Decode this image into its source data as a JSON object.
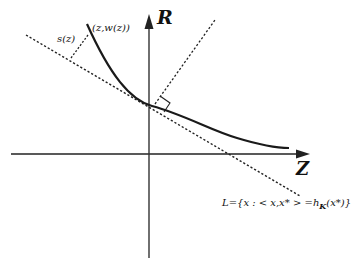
{
  "diagram": {
    "axes": {
      "vertical_label": "R",
      "horizontal_label": "Z"
    },
    "labels": {
      "point": "(z,w(z))",
      "distance": "s(z)",
      "line_L": "L={x : < x,x* > =h",
      "line_L_sub": "K",
      "line_L_tail": "(x*)}"
    },
    "colors": {
      "ink": "#1a1a1a",
      "background": "#ffffff"
    }
  }
}
